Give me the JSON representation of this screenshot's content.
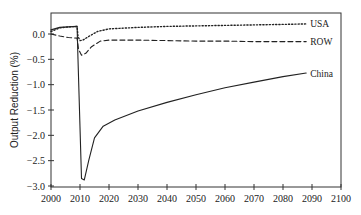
{
  "chart_data": {
    "type": "line",
    "title": "",
    "xlabel": "",
    "ylabel": "Output Reduction (%)",
    "xlim": [
      2000,
      2100
    ],
    "ylim": [
      -3.0,
      0.3
    ],
    "grid": false,
    "legend_position": "inline labels at right end of each line",
    "x_ticks": [
      2000,
      2010,
      2020,
      2030,
      2040,
      2050,
      2060,
      2070,
      2080,
      2090,
      2100
    ],
    "x_tick_labels": [
      "2000",
      "2010",
      "2020",
      "2030",
      "2040",
      "2050",
      "2060",
      "2070",
      "2080",
      "2090",
      "2100"
    ],
    "y_ticks": [
      0.0,
      -0.5,
      -1.0,
      -1.5,
      -2.0,
      -2.5,
      -3.0
    ],
    "y_tick_labels": [
      "0.0",
      "−0.5",
      "−1.0",
      "−1.5",
      "−2.0",
      "−2.5",
      "−3.0"
    ],
    "series": [
      {
        "name": "USA",
        "style": "dotted",
        "color": "#222222",
        "x": [
          2000,
          2003,
          2006,
          2009,
          2009.3,
          2010,
          2011,
          2013,
          2016,
          2020,
          2030,
          2040,
          2050,
          2060,
          2070,
          2080,
          2088
        ],
        "y": [
          0.05,
          0.12,
          0.14,
          0.15,
          -0.05,
          -0.13,
          -0.12,
          -0.05,
          0.05,
          0.1,
          0.13,
          0.15,
          0.16,
          0.17,
          0.18,
          0.19,
          0.2
        ]
      },
      {
        "name": "ROW",
        "style": "dashed",
        "color": "#222222",
        "x": [
          2000,
          2003,
          2006,
          2009,
          2009.5,
          2010.5,
          2012,
          2014,
          2017,
          2020,
          2030,
          2040,
          2050,
          2060,
          2070,
          2080,
          2088
        ],
        "y": [
          0.0,
          -0.04,
          -0.07,
          -0.08,
          -0.3,
          -0.42,
          -0.38,
          -0.25,
          -0.14,
          -0.12,
          -0.12,
          -0.13,
          -0.14,
          -0.14,
          -0.15,
          -0.15,
          -0.15
        ]
      },
      {
        "name": "China",
        "style": "solid",
        "color": "#222222",
        "x": [
          2000,
          2003,
          2006,
          2009,
          2009.3,
          2010.5,
          2011.5,
          2013,
          2015,
          2018,
          2022,
          2030,
          2040,
          2050,
          2060,
          2070,
          2080,
          2088
        ],
        "y": [
          0.08,
          0.13,
          0.14,
          0.15,
          -0.5,
          -2.85,
          -2.88,
          -2.5,
          -2.05,
          -1.82,
          -1.7,
          -1.52,
          -1.35,
          -1.2,
          -1.06,
          -0.95,
          -0.84,
          -0.77
        ]
      }
    ]
  }
}
